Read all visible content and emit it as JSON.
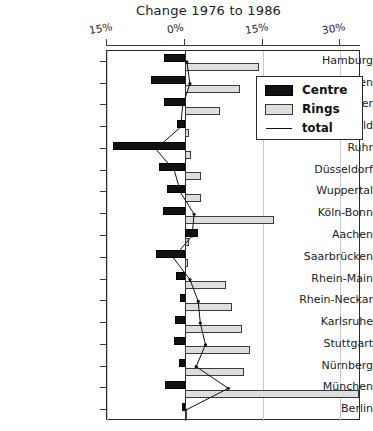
{
  "chart_data": {
    "type": "bar",
    "orientation": "horizontal",
    "title": "Change 1976 to 1986",
    "xlabel": "",
    "ylabel": "",
    "xlim": [
      -15,
      34
    ],
    "xticks": [
      -15,
      0,
      15,
      30
    ],
    "xtick_labels": [
      "15%",
      "0%",
      "15%",
      "30%"
    ],
    "grid": true,
    "legend_position": "upper right",
    "categories": [
      "Hamburg",
      "Bremen",
      "Hannover",
      "Bielefeld",
      "Ruhr",
      "Düsseldorf",
      "Wuppertal",
      "Köln-Bonn",
      "Aachen",
      "Saarbrücken",
      "Rhein-Main",
      "Rhein-Neckar",
      "Karlsruhe",
      "Stuttgart",
      "Nürnberg",
      "München",
      "Berlin"
    ],
    "series": [
      {
        "name": "Centre",
        "color": "#111111",
        "values": [
          -4.0,
          -6.5,
          -4.0,
          -1.4,
          -13.8,
          -5.0,
          -3.4,
          -4.2,
          2.6,
          -5.6,
          -1.6,
          -1.0,
          -1.8,
          -2.0,
          -1.2,
          -3.8,
          -0.6
        ]
      },
      {
        "name": "Rings",
        "color": "#dedede",
        "values": [
          14.4,
          10.6,
          6.8,
          0.8,
          1.2,
          3.2,
          3.2,
          17.2,
          0.8,
          0.6,
          8.0,
          9.2,
          11.0,
          12.6,
          11.4,
          33.6,
          0.5
        ]
      },
      {
        "name": "total",
        "color": "#111111",
        "type": "line",
        "values": [
          0.4,
          1.0,
          -0.4,
          -0.8,
          -5.6,
          -2.0,
          -0.8,
          1.8,
          1.4,
          -2.2,
          1.0,
          2.6,
          3.0,
          4.0,
          2.2,
          8.4,
          0.2
        ]
      }
    ]
  },
  "legend": {
    "entries": [
      {
        "label": "Centre",
        "swatch": "black-filled-rect"
      },
      {
        "label": "Rings",
        "swatch": "gray-filled-rect"
      },
      {
        "label": "total",
        "swatch": "thin-line"
      }
    ]
  }
}
